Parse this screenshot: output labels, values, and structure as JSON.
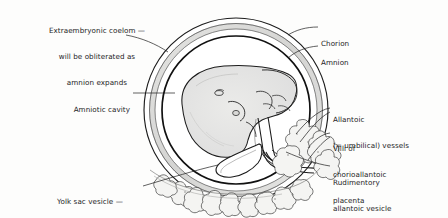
{
  "figure": {
    "type": "anatomical-diagram",
    "background_color": "#fdfdfc",
    "ink_color": "#1c1c1c"
  },
  "labels": [
    {
      "id": "extraembryonic-coelom",
      "lines": [
        "Extraembryonic coelom —",
        "will be obliterated as",
        "amnion expands"
      ],
      "align": "center"
    },
    {
      "id": "amniotic-cavity",
      "lines": [
        "Amniotic cavity"
      ],
      "align": "right"
    },
    {
      "id": "yolk-sac-vesicle",
      "lines": [
        "Yolk sac vesicle —",
        "contains no yolk"
      ],
      "align": "center"
    },
    {
      "id": "chorion",
      "lines": [
        "Chorion"
      ],
      "align": "left"
    },
    {
      "id": "amnion",
      "lines": [
        "Amnion"
      ],
      "align": "left"
    },
    {
      "id": "allantoic-vessels",
      "lines": [
        "Allantoic",
        "(= umbilical) vessels"
      ],
      "align": "left"
    },
    {
      "id": "villi-chorioallantoic-placenta",
      "lines": [
        "Villi of",
        "chorioallantoic",
        "placenta"
      ],
      "align": "left"
    },
    {
      "id": "rudimentary-allantoic-vesicle",
      "lines": [
        "Rudimentory",
        "allantoic vesicle"
      ],
      "align": "left"
    }
  ],
  "structures": {
    "chorion_label": "chorion-outer-membrane",
    "amnion_label": "amnion-inner-membrane",
    "embryo_label": "embryo-body",
    "umbilical_cord_label": "umbilical-cord",
    "yolk_sac_label": "yolk-sac-vesicle-shape",
    "placenta_label": "chorionic-villi-cluster"
  }
}
